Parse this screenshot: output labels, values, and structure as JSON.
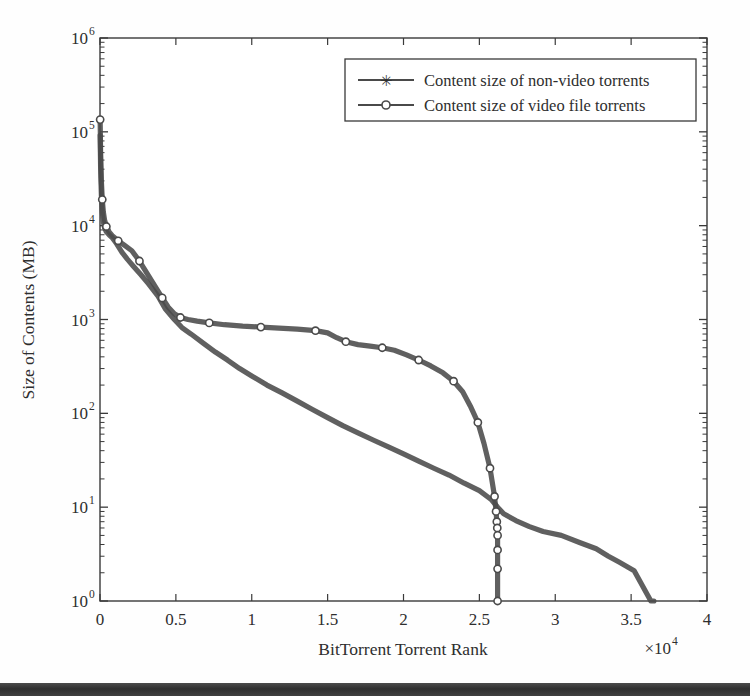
{
  "chart_data": {
    "type": "line",
    "title": "",
    "xlabel": "BitTorrent Torrent Rank",
    "ylabel": "Size of Contents (MB)",
    "x_multiplier": "×10",
    "x_multiplier_exp": "4",
    "xlim": [
      0,
      40000
    ],
    "ylim": [
      1,
      1000000
    ],
    "yscale": "log",
    "xscale": "linear",
    "grid": false,
    "legend_position": "top-right",
    "xticks": [
      0,
      0.5,
      1,
      1.5,
      2,
      2.5,
      3,
      3.5,
      4
    ],
    "xtick_labels": [
      "0",
      "0.5",
      "1",
      "1.5",
      "2",
      "2.5",
      "3",
      "3.5",
      "4"
    ],
    "ytick_labels": [
      "10",
      "10",
      "10",
      "10",
      "10",
      "10",
      "10"
    ],
    "ytick_exponents": [
      "0",
      "1",
      "2",
      "3",
      "4",
      "5",
      "6"
    ],
    "ytick_values": [
      1,
      10,
      100,
      1000,
      10000,
      100000,
      1000000
    ],
    "series": [
      {
        "name": "Content size of non-video torrents",
        "marker": "star-icon",
        "color": "#4a4a4a",
        "x": [
          10,
          40,
          90,
          150,
          220,
          300,
          420,
          600,
          820,
          1100,
          1450,
          1800,
          2200,
          2700,
          3200,
          3800,
          4300,
          4900,
          5400,
          6000,
          6800,
          7600,
          8400,
          9200,
          10000,
          11000,
          12000,
          13000,
          14000,
          15000,
          16000,
          17000,
          18000,
          19000,
          20000,
          21000,
          22000,
          23000,
          24000,
          25000,
          25800,
          26200,
          26600,
          27400,
          28300,
          29200,
          30400,
          31600,
          32700,
          33500,
          34200,
          35200,
          36300,
          36500
        ],
        "y": [
          92000,
          42000,
          21000,
          14000,
          11000,
          9500,
          8600,
          8000,
          7400,
          6400,
          5200,
          4400,
          3700,
          3000,
          2400,
          1800,
          1300,
          1000,
          820,
          700,
          560,
          450,
          370,
          300,
          250,
          200,
          165,
          135,
          110,
          90,
          74,
          62,
          52,
          44,
          37,
          31,
          26,
          22,
          18,
          15,
          12,
          10,
          8.5,
          7.2,
          6.2,
          5.5,
          5.0,
          4.2,
          3.6,
          3.0,
          2.6,
          2.1,
          1.0,
          1.0
        ]
      },
      {
        "name": "Content size of video file torrents",
        "marker": "circle-icon",
        "color": "#4a4a4a",
        "x": [
          10,
          40,
          90,
          150,
          220,
          300,
          420,
          600,
          850,
          1200,
          1600,
          2100,
          2600,
          3100,
          3600,
          4100,
          4500,
          4900,
          5300,
          5800,
          6400,
          7200,
          8200,
          9400,
          10600,
          11800,
          13000,
          14200,
          15000,
          15600,
          16200,
          17000,
          17800,
          18600,
          19400,
          20200,
          21000,
          21800,
          22600,
          23300,
          23900,
          24400,
          24900,
          25300,
          25700,
          26000,
          26100,
          26150,
          26180,
          26200,
          26200,
          26200,
          26200
        ],
        "y": [
          135000,
          60000,
          30000,
          19000,
          14000,
          11500,
          9800,
          8600,
          7700,
          6900,
          6200,
          5400,
          4200,
          3100,
          2300,
          1700,
          1350,
          1150,
          1050,
          1000,
          960,
          920,
          880,
          850,
          830,
          810,
          790,
          760,
          720,
          640,
          580,
          540,
          520,
          500,
          470,
          420,
          370,
          320,
          270,
          220,
          170,
          120,
          80,
          48,
          26,
          13,
          9,
          7,
          6,
          5,
          3.5,
          2.2,
          1.0
        ]
      }
    ]
  },
  "legend": {
    "entries": [
      {
        "label": "Content size of non-video torrents",
        "marker": "star-icon"
      },
      {
        "label": "Content size of video file torrents",
        "marker": "circle-icon"
      }
    ]
  },
  "colors": {
    "line": "#4a4a4a",
    "axis": "#3a3a3a",
    "text": "#2e2e2e",
    "background": "#fefefe"
  }
}
